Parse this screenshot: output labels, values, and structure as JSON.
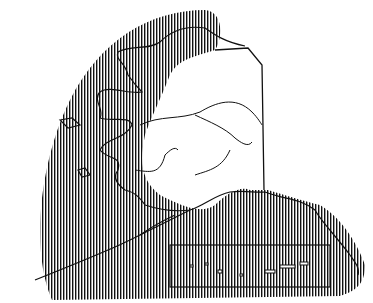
{
  "map": {
    "subject": "Alaska",
    "style": "black-and-white line map with vertical hatching",
    "colors": {
      "background": "#ffffff",
      "ink": "#111111"
    },
    "regions": [
      {
        "name": "hatched-range",
        "description": "vertically hatched region covering western Alaska and surrounding seas"
      },
      {
        "name": "unhatched-interior",
        "description": "white interior and north slope area"
      }
    ],
    "features": [
      "coastline",
      "rivers",
      "canada-border",
      "aleutian-islands",
      "inset-frame"
    ]
  }
}
